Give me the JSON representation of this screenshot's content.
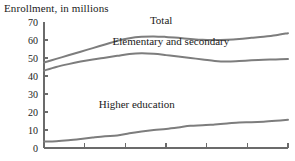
{
  "chart_data": {
    "type": "line",
    "title": "Enrollment, in millions",
    "xlabel": "",
    "ylabel": "",
    "ylim": [
      0,
      70
    ],
    "yticks": [
      0,
      10,
      20,
      30,
      40,
      50,
      60,
      70
    ],
    "ytick_labels": [
      "0",
      "10",
      "20",
      "30",
      "40",
      "50",
      "60",
      "70"
    ],
    "xlim": [
      0,
      100
    ],
    "xticks": [
      0,
      16.7,
      33.3,
      50,
      66.7,
      83.3,
      100
    ],
    "xtick_labels": [
      "",
      "",
      "",
      "",
      "",
      "",
      ""
    ],
    "grid": false,
    "legend": "inline-annotations",
    "line_color": "#7d7d7d",
    "axis_color": "#6b6b6b",
    "text_color": "#1a1a1a",
    "annotations": [
      {
        "text": "Total",
        "x": 48,
        "y": 69
      },
      {
        "text": "Elementary and secondary",
        "x": 52,
        "y": 57
      },
      {
        "text": "Higher education",
        "x": 38,
        "y": 22
      }
    ],
    "series": [
      {
        "name": "Total",
        "label": "Total",
        "x": [
          0,
          5,
          10,
          15,
          20,
          25,
          30,
          35,
          40,
          45,
          50,
          55,
          60,
          65,
          70,
          75,
          80,
          85,
          90,
          95,
          100
        ],
        "values": [
          47.5,
          49.5,
          51.5,
          53.5,
          55.5,
          57.5,
          59.5,
          61.0,
          61.8,
          62.0,
          61.7,
          61.2,
          60.6,
          60.1,
          60.0,
          60.2,
          60.6,
          61.2,
          61.8,
          62.6,
          63.8
        ]
      },
      {
        "name": "Elementary and secondary",
        "label": "Elementary and secondary",
        "x": [
          0,
          5,
          10,
          15,
          20,
          25,
          30,
          35,
          40,
          45,
          50,
          55,
          60,
          65,
          70,
          75,
          80,
          85,
          90,
          95,
          100
        ],
        "values": [
          43.0,
          45.0,
          46.6,
          48.0,
          49.2,
          50.2,
          51.2,
          52.2,
          52.6,
          52.3,
          51.6,
          50.8,
          50.0,
          49.2,
          48.3,
          48.0,
          48.3,
          48.7,
          49.0,
          49.2,
          49.4
        ]
      },
      {
        "name": "Higher education",
        "label": "Higher education",
        "x": [
          0,
          5,
          10,
          15,
          20,
          25,
          30,
          35,
          40,
          45,
          50,
          55,
          60,
          65,
          70,
          75,
          80,
          85,
          90,
          95,
          100
        ],
        "values": [
          3.6,
          3.8,
          4.3,
          5.0,
          5.8,
          6.5,
          6.9,
          8.2,
          9.2,
          10.0,
          10.6,
          11.4,
          12.3,
          12.6,
          13.1,
          13.6,
          14.2,
          14.3,
          14.6,
          15.1,
          15.7
        ]
      }
    ]
  },
  "layout": {
    "plot_left": 44,
    "plot_right": 288,
    "plot_top": 22,
    "plot_bottom": 148
  }
}
